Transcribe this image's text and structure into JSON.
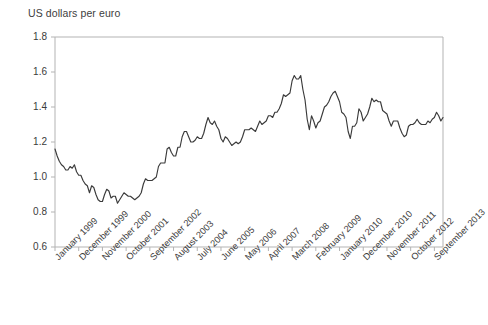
{
  "chart_data": {
    "type": "line",
    "title": "US dollars per euro",
    "xlabel": "",
    "ylabel": "US dollars per euro",
    "ylim": [
      0.6,
      1.8
    ],
    "yticks": [
      "0.6",
      "0.8",
      "1.0",
      "1.2",
      "1.4",
      "1.6",
      "1.8"
    ],
    "ytick_values": [
      0.6,
      0.8,
      1.0,
      1.2,
      1.4,
      1.6,
      1.8
    ],
    "grid": false,
    "legend": "none",
    "line_color": "#3a3a3a",
    "axis_color": "#b3b3b3",
    "xtick_labels": [
      "January 1999",
      "December 1999",
      "November 2000",
      "October 2001",
      "September 2002",
      "August 2003",
      "July 2004",
      "June 2005",
      "May 2006",
      "April 2007",
      "March 2008",
      "February 2009",
      "January 2010",
      "December 2010",
      "November 2011",
      "October 2012",
      "September 2013"
    ],
    "xtick_indices": [
      0,
      11,
      22,
      33,
      44,
      55,
      66,
      77,
      88,
      99,
      110,
      121,
      132,
      143,
      154,
      165,
      176
    ],
    "x_start": "January 1999",
    "x_end": "September 2013",
    "x_interval": "monthly",
    "series": [
      {
        "name": "US dollars per euro",
        "values": [
          1.16,
          1.12,
          1.09,
          1.07,
          1.06,
          1.04,
          1.04,
          1.06,
          1.05,
          1.07,
          1.03,
          1.01,
          1.01,
          0.98,
          0.96,
          0.95,
          0.91,
          0.95,
          0.94,
          0.9,
          0.87,
          0.86,
          0.86,
          0.9,
          0.93,
          0.92,
          0.88,
          0.89,
          0.89,
          0.85,
          0.87,
          0.89,
          0.91,
          0.9,
          0.89,
          0.89,
          0.88,
          0.87,
          0.88,
          0.89,
          0.91,
          0.96,
          0.99,
          0.98,
          0.98,
          0.98,
          0.99,
          1.0,
          1.06,
          1.08,
          1.08,
          1.08,
          1.16,
          1.17,
          1.14,
          1.12,
          1.12,
          1.17,
          1.17,
          1.23,
          1.26,
          1.26,
          1.23,
          1.2,
          1.2,
          1.21,
          1.23,
          1.22,
          1.22,
          1.25,
          1.3,
          1.34,
          1.31,
          1.3,
          1.32,
          1.29,
          1.27,
          1.22,
          1.2,
          1.23,
          1.22,
          1.2,
          1.18,
          1.19,
          1.2,
          1.19,
          1.2,
          1.23,
          1.27,
          1.27,
          1.27,
          1.28,
          1.27,
          1.26,
          1.29,
          1.32,
          1.3,
          1.31,
          1.32,
          1.35,
          1.35,
          1.34,
          1.37,
          1.37,
          1.39,
          1.42,
          1.47,
          1.46,
          1.47,
          1.48,
          1.55,
          1.58,
          1.56,
          1.56,
          1.58,
          1.5,
          1.44,
          1.33,
          1.27,
          1.35,
          1.32,
          1.28,
          1.31,
          1.32,
          1.36,
          1.4,
          1.41,
          1.43,
          1.46,
          1.48,
          1.49,
          1.46,
          1.43,
          1.37,
          1.36,
          1.34,
          1.26,
          1.22,
          1.29,
          1.29,
          1.31,
          1.39,
          1.37,
          1.32,
          1.34,
          1.36,
          1.4,
          1.45,
          1.43,
          1.44,
          1.43,
          1.43,
          1.38,
          1.37,
          1.36,
          1.32,
          1.29,
          1.32,
          1.32,
          1.32,
          1.28,
          1.25,
          1.23,
          1.24,
          1.29,
          1.3,
          1.3,
          1.31,
          1.33,
          1.31,
          1.3,
          1.3,
          1.3,
          1.32,
          1.31,
          1.33,
          1.34,
          1.37,
          1.35,
          1.32,
          1.34
        ]
      }
    ]
  }
}
